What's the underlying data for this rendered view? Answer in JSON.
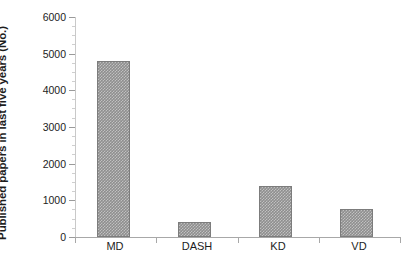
{
  "chart_data": {
    "type": "bar",
    "title": "",
    "subtitle": "",
    "xlabel": "",
    "ylabel": "Published papers in last five years (No.)",
    "categories": [
      "MD",
      "DASH",
      "KD",
      "VD"
    ],
    "values": [
      4800,
      400,
      1400,
      770
    ],
    "series": [
      {
        "name": "Published papers in last five years (No.)",
        "values": [
          4800,
          400,
          1400,
          770
        ]
      }
    ],
    "ylim": [
      0,
      6000
    ],
    "y_ticks": [
      0,
      1000,
      2000,
      3000,
      4000,
      5000,
      6000
    ],
    "y_tick_labels": [
      "0",
      "1000",
      "2000",
      "3000",
      "4000",
      "5000",
      "6000"
    ],
    "grid": false,
    "legend": false,
    "legend_position": "none",
    "bar_color": "#8e8e8e",
    "bar_pattern": "checkered-dither",
    "axis_color": "#a8a8a8",
    "text_color": "#1d1d1d",
    "background_color": "#ffffff",
    "annotations": []
  }
}
